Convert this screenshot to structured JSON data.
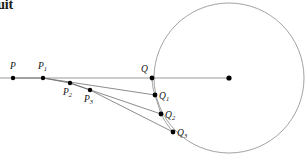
{
  "figure": {
    "title_text": "rsuit",
    "background_color": "#ffffff",
    "width": 307,
    "height": 160,
    "stroke_color": "#6e6e6e",
    "axis_color": "#9a9a9a",
    "point_color": "#000000",
    "label_color": "#111111"
  },
  "circle": {
    "name": "target-circle",
    "center_x": 229,
    "center_y": 78,
    "radius": 75,
    "center_point_label": ""
  },
  "axis": {
    "name": "horizontal-line",
    "x1": 0,
    "y1": 78,
    "x2": 229,
    "y2": 78
  },
  "points": [
    {
      "id": "P",
      "base": "P",
      "sub": "",
      "x": 13,
      "y": 78,
      "lx": 10,
      "ly": 69,
      "r": 2.2
    },
    {
      "id": "P1",
      "base": "P",
      "sub": "1",
      "x": 43,
      "y": 78,
      "lx": 38,
      "ly": 69,
      "r": 2.2
    },
    {
      "id": "P2",
      "base": "P",
      "sub": "2",
      "x": 70,
      "y": 83,
      "lx": 63,
      "ly": 95,
      "r": 2.2
    },
    {
      "id": "P3",
      "base": "P",
      "sub": "3",
      "x": 90,
      "y": 90,
      "lx": 84,
      "ly": 102,
      "r": 2.2
    },
    {
      "id": "Q",
      "base": "Q",
      "sub": "",
      "x": 152,
      "y": 78,
      "lx": 141,
      "ly": 72,
      "r": 2.4
    },
    {
      "id": "Q1",
      "base": "Q",
      "sub": "1",
      "x": 155,
      "y": 95,
      "lx": 159,
      "ly": 99,
      "r": 2.4
    },
    {
      "id": "Q2",
      "base": "Q",
      "sub": "2",
      "x": 161,
      "y": 114,
      "lx": 165,
      "ly": 118,
      "r": 2.4
    },
    {
      "id": "Q3",
      "base": "Q",
      "sub": "3",
      "x": 173,
      "y": 132,
      "lx": 177,
      "ly": 136,
      "r": 2.4
    }
  ],
  "sight_lines": [
    {
      "name": "sight-line-P1-Q1",
      "from": "P1",
      "to": "Q1",
      "x1": 43,
      "y1": 78,
      "x2": 155,
      "y2": 95
    },
    {
      "name": "sight-line-P2-Q2",
      "from": "P2",
      "to": "Q2",
      "x1": 70,
      "y1": 83,
      "x2": 161,
      "y2": 114
    },
    {
      "name": "sight-line-P3-Q3",
      "from": "P3",
      "to": "Q3",
      "x1": 90,
      "y1": 90,
      "x2": 173,
      "y2": 132
    }
  ],
  "pursuit_path": {
    "name": "pursuit-curve",
    "points": "13,78 43,78 70,83 90,90"
  },
  "target_path": {
    "name": "target-arc-path",
    "d": "M 152,78 C 152.5,86 153.2,90.5 155,95 C 157,101 159,108 161,114 C 164.5,121 169,127 173,132"
  }
}
